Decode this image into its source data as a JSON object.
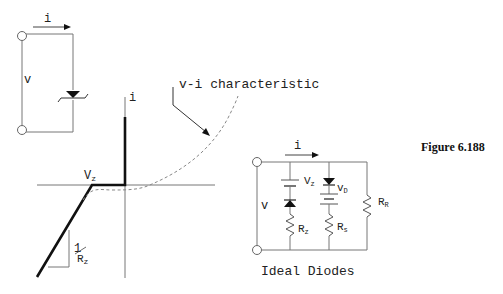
{
  "figure": {
    "caption": "Figure 6.188"
  },
  "zener_symbol_circuit": {
    "current_label": "i",
    "voltage_label": "v"
  },
  "vi_plot": {
    "y_axis_label": "i",
    "knee_label": "V",
    "knee_subscript": "z",
    "slope_numerator": "1",
    "slope_denominator": "R",
    "slope_denominator_subscript": "z",
    "curve_annotation": "v-i characteristic"
  },
  "equivalent_circuit": {
    "current_label": "i",
    "voltage_label": "v",
    "zener_source_label": "V",
    "zener_source_subscript": "z",
    "zener_resistor_label": "R",
    "zener_resistor_subscript": "z",
    "diode_voltage_label": "v",
    "diode_voltage_subscript": "D",
    "series_resistor_label": "R",
    "series_resistor_subscript": "s",
    "reverse_resistor_label": "R",
    "reverse_resistor_subscript": "R",
    "caption": "Ideal Diodes"
  }
}
